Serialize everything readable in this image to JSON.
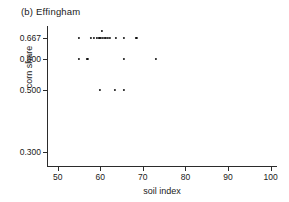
{
  "chart_data": {
    "type": "scatter",
    "title": "(b) Effingham",
    "xlabel": "soil index",
    "ylabel": "corn share",
    "xlim": [
      47.5,
      101.5
    ],
    "ylim": [
      0.255,
      0.705
    ],
    "grid": false,
    "legend": null,
    "xticks": [
      50,
      60,
      70,
      80,
      90,
      100
    ],
    "xtick_labels": [
      "50",
      "60",
      "70",
      "80",
      "90",
      "100"
    ],
    "yticks": [
      0.667,
      0.6,
      0.5,
      0.3
    ],
    "ytick_labels": [
      "0.667",
      "0.600",
      "0.500",
      "0.300"
    ],
    "marker": "dot",
    "marker_color": "#111111",
    "axis_color": "#2b2b2b",
    "background_color": "#ffffff",
    "points": [
      {
        "x": 55.0,
        "y": 0.667
      },
      {
        "x": 57.8,
        "y": 0.667
      },
      {
        "x": 58.6,
        "y": 0.667
      },
      {
        "x": 59.3,
        "y": 0.667
      },
      {
        "x": 59.8,
        "y": 0.667
      },
      {
        "x": 60.2,
        "y": 0.667
      },
      {
        "x": 60.6,
        "y": 0.667
      },
      {
        "x": 61.0,
        "y": 0.667
      },
      {
        "x": 61.4,
        "y": 0.667
      },
      {
        "x": 61.8,
        "y": 0.667
      },
      {
        "x": 62.2,
        "y": 0.667
      },
      {
        "x": 63.6,
        "y": 0.667
      },
      {
        "x": 65.5,
        "y": 0.667
      },
      {
        "x": 68.5,
        "y": 0.667
      },
      {
        "x": 60.3,
        "y": 0.69
      },
      {
        "x": 55.0,
        "y": 0.6
      },
      {
        "x": 57.0,
        "y": 0.6
      },
      {
        "x": 65.5,
        "y": 0.6
      },
      {
        "x": 73.0,
        "y": 0.6
      },
      {
        "x": 60.0,
        "y": 0.5
      },
      {
        "x": 63.5,
        "y": 0.5
      },
      {
        "x": 65.5,
        "y": 0.5
      }
    ]
  }
}
